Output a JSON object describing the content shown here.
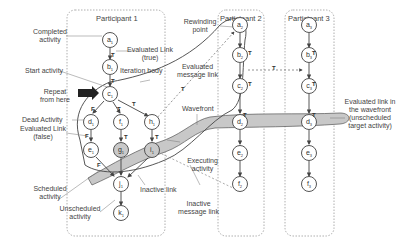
{
  "participants": [
    {
      "title": "Participant 1"
    },
    {
      "title": "Participant 2"
    },
    {
      "title": "Participant 3"
    }
  ],
  "nodes": {
    "p1": [
      "a1",
      "b1",
      "c1",
      "d1",
      "f1",
      "h1",
      "e1",
      "g1",
      "i1",
      "j1",
      "k1"
    ],
    "p2": [
      "a2",
      "b2",
      "c2",
      "d2",
      "e2",
      "f2"
    ],
    "p3": [
      "a3",
      "b3",
      "c3",
      "d3",
      "e3",
      "f3"
    ]
  },
  "node_labels": {
    "a1": "a",
    "b1": "b",
    "c1": "c",
    "d1": "d",
    "f1": "f",
    "h1": "h",
    "e1": "e",
    "g1": "g",
    "i1": "i",
    "j1": "j",
    "k1": "k",
    "a2": "a",
    "b2": "b",
    "c2": "c",
    "d2": "d",
    "e2": "e",
    "f2": "f",
    "a3": "a",
    "b3": "b",
    "c3": "c",
    "d3": "d",
    "e3": "e",
    "f3": "f",
    "sub1": "1",
    "sub2": "2",
    "sub3": "3"
  },
  "annotations": {
    "completed_activity": "Completed activity",
    "evaluated_link_true": "Evaluated Link (true)",
    "start_activity": "Start activity",
    "iteration_body": "Iteration body",
    "repeat_from_here": "Repeat from here",
    "dead_activity": "Dead Activity",
    "evaluated_link_false": "Evaluated Link (false)",
    "scheduled_activity": "Scheduled activity",
    "unscheduled_activity": "Unscheduled activity",
    "inactive_link": "Inactive link",
    "rewinding_point": "Rewinding point",
    "evaluated_message_link": "Evaluated message link",
    "wavefront": "Wavefront",
    "executing_activity": "Executing activity",
    "inactive_message_link": "Inactive message link",
    "evaluated_link_wavefront": "Evaluated link in the wavefront (unscheduled target activity)"
  },
  "link_labels": {
    "true": "T",
    "false": "F"
  },
  "colors": {
    "wavefront_fill": "#c8c8c8",
    "line": "#444444",
    "box_border": "#999999"
  }
}
